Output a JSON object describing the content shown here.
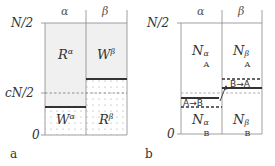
{
  "panel_a": {
    "label": "a",
    "col_left": "α",
    "col_right": "β",
    "y_top": "N/2",
    "y_mid": "cN/2",
    "y_bottom": "0",
    "region_top_left": {
      "base": "R",
      "sup": "α"
    },
    "region_top_right": {
      "base": "W",
      "sup": "β"
    },
    "region_bottom_left": {
      "base": "W",
      "sup": "α"
    },
    "region_bottom_right": {
      "base": "R",
      "sup": "β"
    }
  },
  "panel_b": {
    "label": "b",
    "col_left": "α",
    "col_right": "β",
    "y_top": "N/2",
    "y_bottom": "0",
    "region_top_left": {
      "base": "N",
      "sub": "A",
      "sup": "α"
    },
    "region_top_right": {
      "base": "N",
      "sub": "A",
      "sup": "β"
    },
    "region_bottom_left": {
      "base": "N",
      "sub": "B",
      "sup": "α"
    },
    "region_bottom_right": {
      "base": "N",
      "sub": "B",
      "sup": "β"
    },
    "transition_left": "A→B",
    "transition_right": "B→A"
  },
  "colors": {
    "shade": "#f0f0f0",
    "line": "#777777",
    "thick": "#333333",
    "dot": "#aaaaaa"
  }
}
